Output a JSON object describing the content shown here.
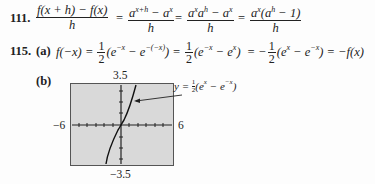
{
  "problem111": {
    "number": "111.",
    "f1_num": "f(x + h) − f(x)",
    "f1_den": "h",
    "f2_num": "a",
    "f2_num_sup": "x+h",
    "f2_num_rest": " − a",
    "f2_num_sup2": "x",
    "f2_den": "h",
    "f3_num": "a",
    "f3_num_sup": "x",
    "f3_num_b": "a",
    "f3_num_sup_b": "h",
    "f3_num_rest": " − a",
    "f3_num_sup2": "x",
    "f3_den": "h",
    "f4_num": "a",
    "f4_num_sup": "x",
    "f4_num_mid": "(a",
    "f4_num_sup_b": "h",
    "f4_num_rest": " − 1)",
    "f4_den": "h",
    "eq": "="
  },
  "problem115": {
    "number": "115.",
    "part_a": "(a)",
    "part_b": "(b)",
    "lhs": "f(−x) =",
    "half_num": "1",
    "half_den": "2",
    "expr1": "(e",
    "expr1_sup1": "−x",
    "expr1_mid": " − e",
    "expr1_sup2": "−(−x)",
    "expr1_end": ") =",
    "expr2": "(e",
    "expr2_sup1": "−x",
    "expr2_mid": " − e",
    "expr2_sup2": "x",
    "expr2_end": ")  = −",
    "expr3": "(e",
    "expr3_sup1": "x",
    "expr3_mid": " − e",
    "expr3_sup2": "−x",
    "expr3_end": ") = −f(x)"
  },
  "graph": {
    "ymax_label": "3.5",
    "ymin_label": "−3.5",
    "xmin_label": "−6",
    "xmax_label": "6",
    "curve_label_y": "y =",
    "curve_label_num": "1",
    "curve_label_den": "2",
    "curve_label_expr": "(e",
    "curve_label_sup1": "x",
    "curve_label_mid": " − e",
    "curve_label_sup2": "−x",
    "curve_label_end": ")",
    "background_color": "#d9d9d9"
  }
}
